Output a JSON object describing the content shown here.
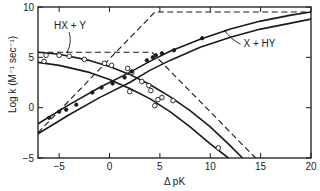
{
  "chart_data": {
    "type": "line",
    "title": "",
    "xlabel": "Δ pK",
    "ylabel": "Log k (M⁻¹ sec⁻¹)",
    "xlim": [
      -7.1,
      20
    ],
    "ylim": [
      -5,
      10
    ],
    "xticks": [
      -5,
      0,
      5,
      10,
      15,
      20
    ],
    "yticks": [
      -5,
      0,
      5,
      10
    ],
    "grid": false,
    "annotations": [
      {
        "text": "HX + Y",
        "x": -5.5,
        "y": 7.8,
        "arrow_to": [
          -4.2,
          5.5
        ]
      },
      {
        "text": "X + HY",
        "x": 13.3,
        "y": 6.0,
        "arrow_to": [
          11.5,
          7.6
        ]
      }
    ],
    "series": [
      {
        "name": "X + HY theoretical limit (dashed)",
        "style": "dashed",
        "x": [
          -7.1,
          4.5,
          20
        ],
        "y": [
          -2.5,
          9.5,
          9.5
        ]
      },
      {
        "name": "HX + Y theoretical limit (dashed)",
        "style": "dashed",
        "x": [
          -7.1,
          4.2,
          14.5
        ],
        "y": [
          5.5,
          5.5,
          -5.0
        ]
      },
      {
        "name": "X + HY curve upper",
        "style": "solid",
        "x": [
          -7.1,
          -4,
          -1,
          2,
          4,
          6,
          9,
          12,
          15,
          18,
          20
        ],
        "y": [
          -1.6,
          0.3,
          2.0,
          3.5,
          4.6,
          5.6,
          6.8,
          7.8,
          8.6,
          9.2,
          9.5
        ]
      },
      {
        "name": "X + HY curve lower",
        "style": "solid",
        "x": [
          -7.1,
          -4,
          -1,
          2,
          4,
          6,
          9,
          12,
          15,
          18,
          20
        ],
        "y": [
          -2.6,
          -0.7,
          1.0,
          2.5,
          3.7,
          4.7,
          6.0,
          7.0,
          7.8,
          8.4,
          8.8
        ]
      },
      {
        "name": "HX + Y curve upper",
        "style": "solid",
        "x": [
          -7.1,
          -5,
          -2,
          0,
          2,
          4,
          6,
          8,
          10,
          12,
          13.2
        ],
        "y": [
          5.5,
          5.3,
          4.7,
          4.1,
          3.3,
          2.3,
          1.1,
          -0.3,
          -1.9,
          -3.8,
          -5.0
        ]
      },
      {
        "name": "HX + Y curve lower",
        "style": "solid",
        "x": [
          -7.1,
          -5,
          -2,
          0,
          2,
          4,
          6,
          8,
          10,
          11.8
        ],
        "y": [
          4.5,
          4.2,
          3.5,
          2.8,
          1.9,
          0.9,
          -0.4,
          -1.9,
          -3.6,
          -5.0
        ]
      },
      {
        "name": "HX + Y data (open circles)",
        "style": "open-circle",
        "points": [
          [
            -6.5,
            4.6
          ],
          [
            -6.3,
            5.2
          ],
          [
            -5.0,
            5.2
          ],
          [
            -4.0,
            5.1
          ],
          [
            -2.5,
            4.8
          ],
          [
            -0.5,
            4.4
          ],
          [
            0.2,
            4.2
          ],
          [
            1.8,
            3.9
          ],
          [
            2.2,
            3.5
          ],
          [
            3.2,
            2.6
          ],
          [
            3.9,
            2.2
          ],
          [
            4.1,
            1.7
          ],
          [
            5.2,
            1.0
          ],
          [
            6.3,
            0.7
          ],
          [
            10.8,
            -4.0
          ],
          [
            4.5,
            0.2
          ],
          [
            2.0,
            1.6
          ],
          [
            4.8,
            0.8
          ]
        ]
      },
      {
        "name": "X + HY data (filled circles)",
        "style": "filled-circle",
        "points": [
          [
            -6.0,
            -1.0
          ],
          [
            -5.0,
            -0.4
          ],
          [
            -4.3,
            -0.2
          ],
          [
            -3.3,
            0.3
          ],
          [
            -1.7,
            1.5
          ],
          [
            -0.8,
            2.0
          ],
          [
            0.3,
            2.4
          ],
          [
            1.5,
            3.0
          ],
          [
            2.2,
            3.6
          ],
          [
            3.7,
            4.7
          ],
          [
            4.3,
            5.0
          ],
          [
            4.6,
            5.2
          ],
          [
            5.2,
            5.4
          ],
          [
            6.4,
            5.7
          ],
          [
            9.2,
            6.9
          ]
        ]
      }
    ]
  }
}
